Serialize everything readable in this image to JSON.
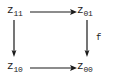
{
  "diagram": {
    "type": "commutative-square",
    "background_color": "#ffffff",
    "ink_color": "#1a1a1a",
    "nodes": [
      {
        "id": "z11",
        "base": "z",
        "subscript": "11",
        "position": "top-left"
      },
      {
        "id": "z01",
        "base": "z",
        "subscript": "01",
        "position": "top-right"
      },
      {
        "id": "z10",
        "base": "z",
        "subscript": "10",
        "position": "bottom-left"
      },
      {
        "id": "z00",
        "base": "z",
        "subscript": "00",
        "position": "bottom-right"
      }
    ],
    "arrows": [
      {
        "id": "top",
        "from": "z11",
        "to": "z01",
        "direction": "right",
        "label": ""
      },
      {
        "id": "bottom",
        "from": "z10",
        "to": "z00",
        "direction": "right",
        "label": ""
      },
      {
        "id": "left",
        "from": "z11",
        "to": "z10",
        "direction": "down",
        "label": ""
      },
      {
        "id": "right",
        "from": "z01",
        "to": "z00",
        "direction": "down",
        "label": "f"
      }
    ],
    "labels": {
      "right_arrow_label": "f"
    }
  }
}
